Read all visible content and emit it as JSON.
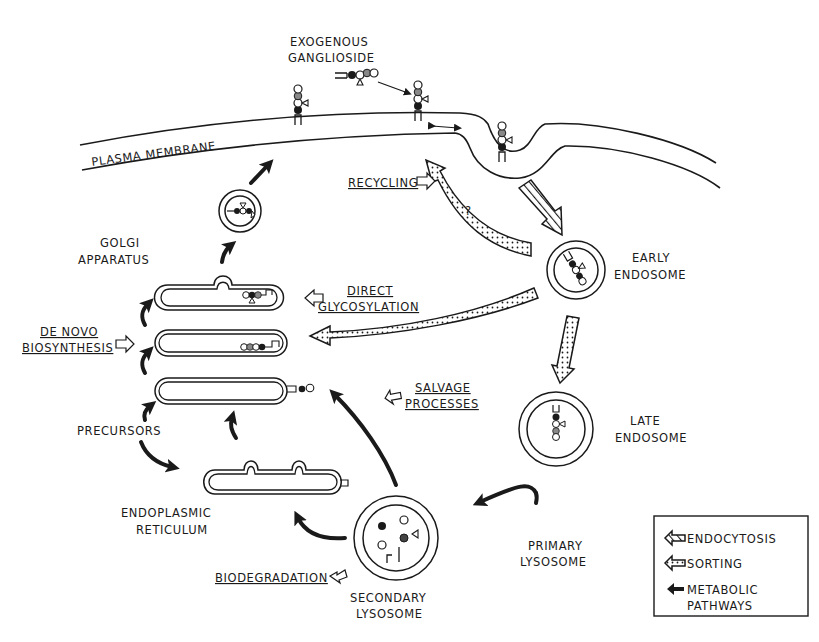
{
  "diagram": {
    "labels": {
      "exogenous_ganglioside": [
        "EXOGENOUS",
        "GANGLIOSIDE"
      ],
      "plasma_membrane": "PLASMA MEMBRANE",
      "golgi_apparatus": [
        "GOLGI",
        "APPARATUS"
      ],
      "recycling": "RECYCLING",
      "question_mark": "?",
      "early_endosome": [
        "EARLY",
        "ENDOSOME"
      ],
      "direct_glycosylation": [
        "DIRECT",
        "GLYCOSYLATION"
      ],
      "de_novo_biosynthesis": [
        "DE NOVO",
        "BIOSYNTHESIS"
      ],
      "late_endosome": [
        "LATE",
        "ENDOSOME"
      ],
      "precursors": "PRECURSORS",
      "salvage_processes": [
        "SALVAGE",
        "PROCESSES"
      ],
      "endoplasmic_reticulum": [
        "ENDOPLASMIC",
        "RETICULUM"
      ],
      "primary_lysosome": [
        "PRIMARY",
        "LYSOSOME"
      ],
      "biodegradation": "BIODEGRADATION",
      "secondary_lysosome": [
        "SECONDARY",
        "LYSOSOME"
      ]
    },
    "legend": {
      "items": [
        {
          "icon": "hatched-arrow-icon",
          "label": "ENDOCYTOSIS"
        },
        {
          "icon": "dotted-arrow-icon",
          "label": "SORTING"
        },
        {
          "icon": "solid-arrow-icon",
          "label": "METABOLIC"
        },
        {
          "icon": "",
          "label": "PATHWAYS"
        }
      ]
    },
    "colors": {
      "ink": "#1a1a1a",
      "background": "#ffffff"
    }
  }
}
